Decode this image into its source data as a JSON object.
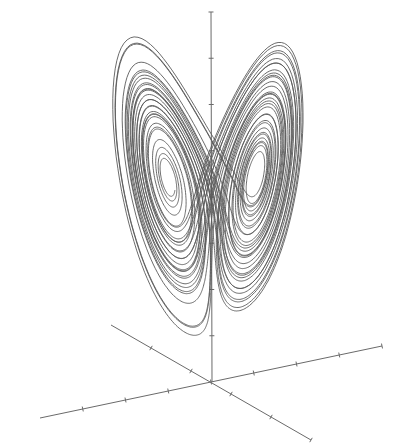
{
  "chart_data": {
    "type": "line",
    "title": "",
    "subtitle": "",
    "system": {
      "sigma": 10,
      "rho": 28,
      "beta": 2.6667
    },
    "axes": {
      "labels": {
        "x": "",
        "y": "",
        "z": ""
      },
      "tick_labels": [],
      "origin_px": [
        212,
        382
      ],
      "vertical_axis": {
        "from": [
          212,
          382
        ],
        "to": [
          211,
          12
        ],
        "ticks": 8
      },
      "axis_a": {
        "from": [
          40,
          418
        ],
        "to": [
          382,
          346
        ],
        "ticks": 8
      },
      "axis_b": {
        "from": [
          111,
          325
        ],
        "to": [
          311,
          440
        ],
        "ticks": 5
      }
    },
    "grid": false,
    "legend": null,
    "colors": {
      "curve": "#5a5a5a",
      "axis": "#6a6a6a",
      "background": "#ffffff"
    }
  }
}
